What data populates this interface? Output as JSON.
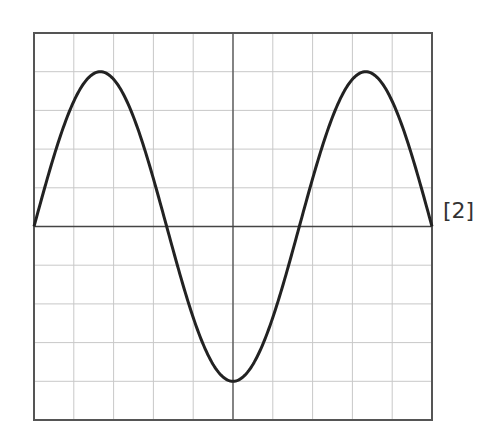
{
  "figure": {
    "grid": {
      "left": 34,
      "top": 33,
      "right": 432,
      "bottom": 420,
      "cols": 10,
      "rows": 10
    },
    "axis_y_px": 227,
    "axis_x_px": 233,
    "colors": {
      "grid": "#c8c8c8",
      "frame": "#555555",
      "axis": "#444444",
      "trace": "#222222"
    }
  },
  "wave": {
    "amplitude_divisions": 4,
    "period_divisions": 6.67,
    "cycles_shown": 1.5,
    "start_phase": "rising from zero at left edge",
    "peaks_x_px": [
      100,
      366
    ],
    "trough_x_px": [
      233
    ],
    "zero_crossings_x_px": [
      34,
      166,
      300,
      432
    ]
  },
  "marks": {
    "label": "[2]"
  }
}
